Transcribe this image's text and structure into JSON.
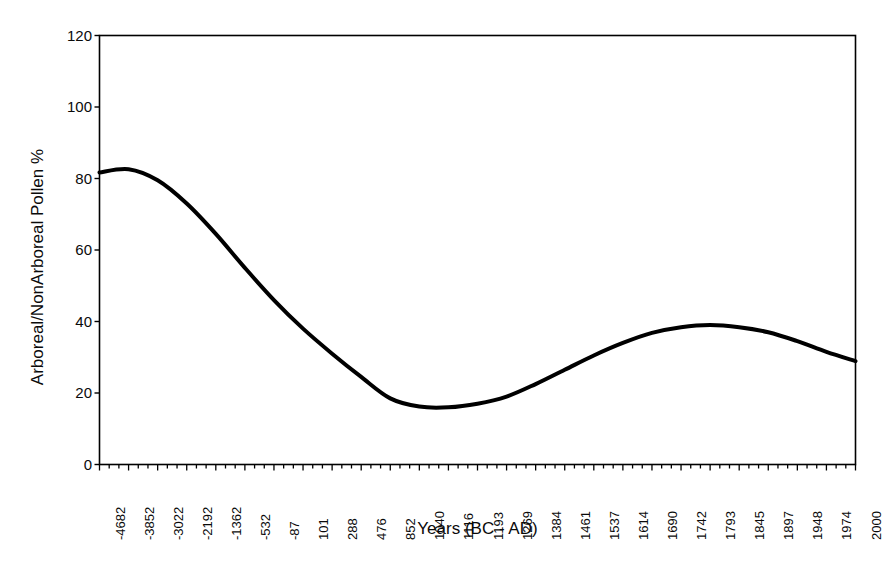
{
  "chart_data": {
    "type": "line",
    "title": "",
    "xlabel": "Years (BC - AD)",
    "ylabel": "Arboreal/NonArboreal Pollen %",
    "ylim": [
      0,
      120
    ],
    "yticks": [
      0,
      20,
      40,
      60,
      80,
      100,
      120
    ],
    "ytick_labels": [
      "0",
      "20",
      "40",
      "60",
      "80",
      "100",
      "120"
    ],
    "grid": false,
    "legend": null,
    "line_color": "#000000",
    "line_width": 4,
    "categories": [
      "-4682",
      "-3852",
      "-3022",
      "-2192",
      "-1362",
      "-532",
      "-87",
      "101",
      "288",
      "476",
      "852",
      "1040",
      "1116",
      "1193",
      "1269",
      "1384",
      "1461",
      "1537",
      "1614",
      "1690",
      "1742",
      "1793",
      "1845",
      "1897",
      "1948",
      "1974",
      "2000"
    ],
    "series": [
      {
        "name": "Arboreal/NonArboreal Pollen %",
        "values": [
          81.7,
          82.6,
          79.5,
          73.0,
          64.5,
          55.0,
          46.0,
          38.0,
          31.0,
          24.5,
          18.5,
          16.2,
          16.0,
          17.0,
          19.0,
          22.5,
          26.5,
          30.5,
          34.0,
          36.8,
          38.4,
          39.0,
          38.4,
          37.0,
          34.5,
          31.5,
          28.9
        ]
      }
    ],
    "annotations": []
  },
  "axes": {
    "x_title": "Years (BC - AD)",
    "y_title": "Arboreal/NonArboreal Pollen %"
  },
  "y_ticks": [
    {
      "label": "120",
      "value": 120
    },
    {
      "label": "100",
      "value": 100
    },
    {
      "label": "80",
      "value": 80
    },
    {
      "label": "60",
      "value": 60
    },
    {
      "label": "40",
      "value": 40
    },
    {
      "label": "20",
      "value": 20
    },
    {
      "label": "0",
      "value": 0
    }
  ],
  "x_ticks": [
    "-4682",
    "-3852",
    "-3022",
    "-2192",
    "-1362",
    "-532",
    "-87",
    "101",
    "288",
    "476",
    "852",
    "1040",
    "1116",
    "1193",
    "1269",
    "1384",
    "1461",
    "1537",
    "1614",
    "1690",
    "1742",
    "1793",
    "1845",
    "1897",
    "1948",
    "1974",
    "2000"
  ]
}
